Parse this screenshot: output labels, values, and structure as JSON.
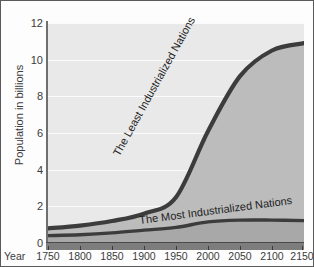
{
  "chart_data": {
    "type": "area",
    "stacked": true,
    "title": "",
    "xlabel": "Year",
    "ylabel": "Population in billions",
    "xlim": [
      1750,
      2150
    ],
    "ylim": [
      0,
      12
    ],
    "grid": true,
    "legend_position": "inline-curve-labels",
    "x": [
      1750,
      1800,
      1850,
      1900,
      1950,
      2000,
      2050,
      2100,
      2150
    ],
    "xticklabels": [
      "1750",
      "1800",
      "1850",
      "1900",
      "1950",
      "2000",
      "2050",
      "2100",
      "2150"
    ],
    "yticks": [
      0,
      2,
      4,
      6,
      8,
      10,
      12
    ],
    "yticklabels": [
      "0",
      "2",
      "4",
      "6",
      "8",
      "10",
      "12"
    ],
    "series": [
      {
        "name": "The Most Industrialized Nations",
        "values": [
          0.4,
          0.45,
          0.55,
          0.7,
          0.85,
          1.15,
          1.25,
          1.25,
          1.22
        ],
        "color": "#a8a8a8",
        "line_color": "#3c3c3c"
      },
      {
        "name": "The Least Industrialized Nations",
        "values": [
          0.4,
          0.5,
          0.65,
          0.9,
          1.65,
          4.95,
          7.85,
          9.25,
          9.68
        ],
        "color": "#bcbcbc",
        "line_color": "#3c3c3c"
      }
    ],
    "total": [
      0.8,
      0.95,
      1.2,
      1.6,
      2.5,
      6.1,
      9.1,
      10.5,
      10.9
    ],
    "annotations": [
      {
        "text": "The Least Industrialized Nations",
        "rotation": -61
      },
      {
        "text": "The Most Industrialized Nations",
        "rotation": -7.5
      }
    ],
    "colors": {
      "plot_background": "#e9e9e9",
      "gridline": "#fbfbfb",
      "upper_band": "#bcbcbc",
      "lower_band": "#a8a8a8",
      "curve_line": "#3c3c3c",
      "axis": "#6f6f6f",
      "text": "#3b3b3b",
      "border": "#5a5a5a"
    }
  }
}
